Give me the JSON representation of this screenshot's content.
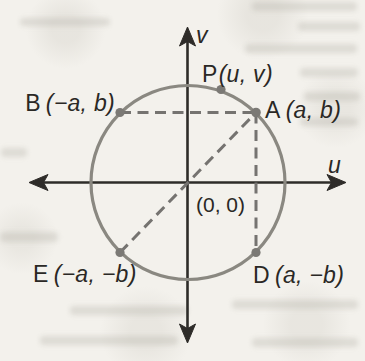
{
  "figure": {
    "axes": {
      "horizontal": "u",
      "vertical": "v"
    },
    "origin": {
      "label": "(0, 0)"
    },
    "points": [
      {
        "name": "P",
        "coords": "(u, v)"
      },
      {
        "name": "A",
        "coords": "(a, b)"
      },
      {
        "name": "B",
        "coords": "(−a, b)"
      },
      {
        "name": "D",
        "coords": "(a, −b)"
      },
      {
        "name": "E",
        "coords": "(−a, −b)"
      }
    ],
    "colors": {
      "axis": "#2e2c29",
      "circle": "#8a8881",
      "dashed": "#757370",
      "dot": "#7b7975",
      "text": "#2a2825",
      "paper": "#f3f1ec"
    }
  }
}
